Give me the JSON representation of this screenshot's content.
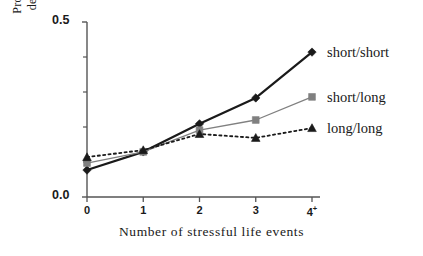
{
  "chart_data": {
    "type": "line",
    "title": "",
    "xlabel": "Number of stressful life events",
    "ylabel_lines": [
      "Probability of major",
      "depression episode"
    ],
    "ylabel": "Probability of major depression episode",
    "categories": [
      "0",
      "1",
      "2",
      "3",
      "4+"
    ],
    "x": [
      0,
      1,
      2,
      3,
      4
    ],
    "xlim": [
      -0.15,
      4.2
    ],
    "ylim": [
      0.0,
      0.5
    ],
    "ytick_labels": [
      "0.0",
      "0.5"
    ],
    "ytick_values": [
      0.0,
      0.5
    ],
    "yminor_ticks": [
      0.1,
      0.2,
      0.3,
      0.4
    ],
    "grid": false,
    "legend_position": "right",
    "series": [
      {
        "name": "short/short",
        "values": [
          0.077,
          0.129,
          0.209,
          0.283,
          0.414
        ],
        "marker": "diamond",
        "linestyle": "solid",
        "color": "#1a1a1a",
        "linewidth": 2.2
      },
      {
        "name": "short/long",
        "values": [
          0.097,
          0.129,
          0.191,
          0.22,
          0.286
        ],
        "marker": "square",
        "linestyle": "solid",
        "color": "#808080",
        "linewidth": 1.3
      },
      {
        "name": "long/long",
        "values": [
          0.114,
          0.134,
          0.18,
          0.169,
          0.197
        ],
        "marker": "triangle",
        "linestyle": "dotted",
        "color": "#1a1a1a",
        "linewidth": 1.8
      }
    ]
  },
  "legend": {
    "entries": [
      {
        "label": "short/short"
      },
      {
        "label": "short/long"
      },
      {
        "label": "long/long"
      }
    ]
  },
  "axes": {
    "x_title": "Number of stressful life events",
    "y_title_line1": "Probability of major",
    "y_title_line2": "depression episode",
    "y_top_label": "0.5",
    "y_bottom_label": "0.0",
    "x_labels": [
      "0",
      "1",
      "2",
      "3",
      "4"
    ],
    "x_last_superscript": "+"
  },
  "colors": {
    "axis": "#555555",
    "series_short_short": "#1a1a1a",
    "series_short_long": "#808080",
    "series_long_long": "#1a1a1a",
    "background": "#ffffff",
    "text": "#1a1a1a"
  }
}
